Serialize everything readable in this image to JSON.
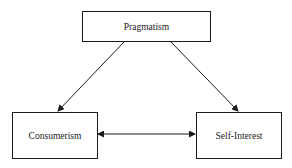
{
  "diagram": {
    "type": "flow",
    "nodes": [
      {
        "id": "pragmatism",
        "label": "Pragmatism"
      },
      {
        "id": "consumerism",
        "label": "Consumerism"
      },
      {
        "id": "self_interest",
        "label": "Self-Interest"
      }
    ],
    "edges": [
      {
        "from": "pragmatism",
        "to": "consumerism",
        "direction": "forward"
      },
      {
        "from": "pragmatism",
        "to": "self_interest",
        "direction": "forward"
      },
      {
        "from": "consumerism",
        "to": "self_interest",
        "direction": "bidirectional"
      }
    ],
    "colors": {
      "stroke": "#1a1a1a",
      "text": "#222222",
      "background": "#ffffff"
    }
  }
}
